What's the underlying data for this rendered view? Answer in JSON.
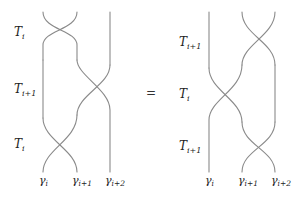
{
  "equation": {
    "operator": "=",
    "left": {
      "generators": [
        {
          "symbol": "T",
          "subscript": "i"
        },
        {
          "symbol": "T",
          "subscript": "i+1"
        },
        {
          "symbol": "T",
          "subscript": "i"
        }
      ],
      "strand_labels": [
        {
          "symbol": "γ",
          "subscript": "i"
        },
        {
          "symbol": "γ",
          "subscript": "i+1"
        },
        {
          "symbol": "γ",
          "subscript": "i+2"
        }
      ]
    },
    "right": {
      "generators": [
        {
          "symbol": "T",
          "subscript": "i+1"
        },
        {
          "symbol": "T",
          "subscript": "i"
        },
        {
          "symbol": "T",
          "subscript": "i+1"
        }
      ],
      "strand_labels": [
        {
          "symbol": "γ",
          "subscript": "i"
        },
        {
          "symbol": "γ",
          "subscript": "i+1"
        },
        {
          "symbol": "γ",
          "subscript": "i+2"
        }
      ]
    }
  },
  "colors": {
    "strand": "#8a8a8a",
    "text": "#222222",
    "background": "#ffffff"
  }
}
